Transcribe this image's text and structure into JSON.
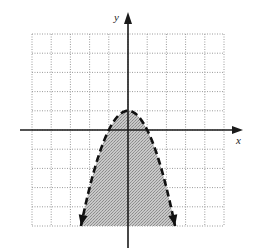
{
  "chart_data": {
    "type": "line",
    "title": "",
    "xlabel": "x",
    "ylabel": "y",
    "xlim": [
      -5,
      5
    ],
    "ylim": [
      -5,
      5
    ],
    "grid": true,
    "grid_step": 1,
    "tick_labels_shown": false,
    "series": [
      {
        "name": "boundary",
        "equation": "y = -x^2 + 1",
        "style": "dashed",
        "vertex": [
          0,
          1
        ],
        "x_intercepts": [
          -1,
          1
        ],
        "y_intercept": 1,
        "end_arrows": [
          [
            -2.45,
            -5
          ],
          [
            2.45,
            -5
          ]
        ],
        "points": [
          [
            -2.45,
            -5
          ],
          [
            -2,
            -3
          ],
          [
            -1.5,
            -1.25
          ],
          [
            -1,
            0
          ],
          [
            -0.5,
            0.75
          ],
          [
            0,
            1
          ],
          [
            0.5,
            0.75
          ],
          [
            1,
            0
          ],
          [
            1.5,
            -1.25
          ],
          [
            2,
            -3
          ],
          [
            2.45,
            -5
          ]
        ]
      }
    ],
    "shaded_region": {
      "description": "inside (below) the parabola",
      "inequality": "y < -x^2 + 1",
      "boundary_inclusive": false
    }
  },
  "labels": {
    "x_axis": "x",
    "y_axis": "y"
  },
  "colors": {
    "axis": "#1a1a1a",
    "grid": "#9a9a9a",
    "shade": "#b4b4b4",
    "curve": "#111111"
  },
  "layout": {
    "origin_px": [
      128,
      130
    ],
    "unit_px": 19.2
  }
}
